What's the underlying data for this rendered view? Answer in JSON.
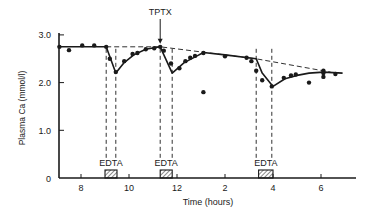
{
  "chart_data": {
    "type": "line",
    "title": "",
    "xlabel": "Time (hours)",
    "ylabel": "Plasma Ca (mmol/l)",
    "ylim": [
      0,
      3.0
    ],
    "xlim_clock_hours": [
      7,
      19.5
    ],
    "grid": false,
    "legend": null,
    "y_ticks": [
      "0",
      "1.0",
      "2.0",
      "3.0"
    ],
    "x_ticks": [
      "8",
      "10",
      "12",
      "2",
      "4",
      "6"
    ],
    "x_tick_positions_continuous_hours": [
      8,
      10,
      12,
      14,
      16,
      18
    ],
    "annotations": [
      {
        "text": "TPTX",
        "type": "arrow",
        "x": 11.3,
        "y": 2.75
      },
      {
        "text": "EDTA",
        "type": "infusion-bar",
        "x_start": 9.0,
        "x_end": 9.5
      },
      {
        "text": "EDTA",
        "type": "infusion-bar",
        "x_start": 11.3,
        "x_end": 11.8
      },
      {
        "text": "EDTA",
        "type": "infusion-bar",
        "x_start": 15.4,
        "x_end": 16.0
      }
    ],
    "series": [
      {
        "name": "Measured plasma Ca",
        "style": "points",
        "x": [
          7.1,
          7.5,
          8.05,
          8.55,
          9.05,
          9.2,
          9.45,
          9.8,
          10.15,
          10.35,
          10.7,
          11.05,
          11.3,
          11.45,
          11.75,
          12.1,
          12.35,
          12.55,
          12.75,
          13.1,
          13.1,
          14.0,
          14.9,
          15.1,
          15.3,
          15.55,
          15.95,
          16.45,
          16.75,
          16.95,
          17.5,
          18.1,
          18.1,
          18.1,
          18.6
        ],
        "y": [
          2.75,
          2.68,
          2.78,
          2.78,
          2.75,
          2.5,
          2.22,
          2.45,
          2.6,
          2.62,
          2.7,
          2.72,
          2.75,
          2.67,
          2.4,
          2.3,
          2.45,
          2.52,
          2.56,
          2.62,
          1.8,
          2.55,
          2.52,
          2.45,
          2.25,
          2.05,
          1.92,
          2.1,
          2.15,
          2.17,
          2.0,
          2.2,
          2.12,
          2.25,
          2.18
        ]
      },
      {
        "name": "Fitted curve",
        "style": "solid",
        "x": [
          7.1,
          9.05,
          9.45,
          9.8,
          10.2,
          10.7,
          11.05,
          11.3,
          11.8,
          12.3,
          12.8,
          13.1,
          14.0,
          15.3,
          15.55,
          16.0,
          16.5,
          17.0,
          17.5,
          18.1,
          18.9
        ],
        "y": [
          2.75,
          2.75,
          2.2,
          2.42,
          2.58,
          2.7,
          2.73,
          2.75,
          2.2,
          2.42,
          2.55,
          2.63,
          2.58,
          2.5,
          2.2,
          1.92,
          2.08,
          2.15,
          2.2,
          2.22,
          2.2
        ]
      },
      {
        "name": "Baseline trend",
        "style": "dashed",
        "x": [
          9.05,
          11.3,
          15.3,
          18.4
        ],
        "y": [
          2.75,
          2.75,
          2.5,
          2.22
        ]
      }
    ],
    "dashed_verticals_x": [
      9.05,
      9.45,
      11.3,
      11.8,
      15.3,
      15.95
    ]
  }
}
